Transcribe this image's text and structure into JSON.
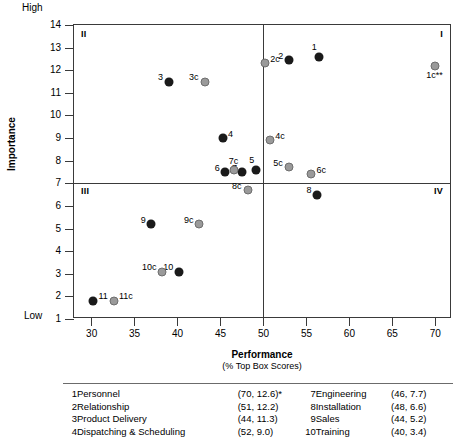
{
  "chart_data": {
    "type": "scatter",
    "title": "",
    "xlabel": "Performance",
    "xsublabel": "(% Top Box Scores)",
    "ylabel": "Importance",
    "xlim": [
      28,
      72
    ],
    "ylim": [
      1,
      14
    ],
    "xticks": [
      30,
      35,
      40,
      45,
      50,
      55,
      60,
      65,
      70
    ],
    "yticks": [
      1,
      2,
      3,
      4,
      5,
      6,
      7,
      8,
      9,
      10,
      11,
      12,
      13,
      14
    ],
    "y_high_label": "High",
    "y_low_label": "Low",
    "grid": false,
    "legend_position": "below-table",
    "quadrant_labels": {
      "q1": "I",
      "q2": "II",
      "q3": "III",
      "q4": "IV"
    },
    "reference_lines": {
      "vertical_x": 50,
      "horizontal_y": 7
    },
    "series": [
      {
        "name": "Company",
        "color": "#1a1a1a",
        "points": [
          {
            "label": "1",
            "x": 56.5,
            "y": 12.6,
            "label_pos": "top-left"
          },
          {
            "label": "2",
            "x": 53.0,
            "y": 12.45,
            "label_pos": "left"
          },
          {
            "label": "3",
            "x": 39.0,
            "y": 11.5,
            "label_pos": "left"
          },
          {
            "label": "4",
            "x": 45.3,
            "y": 9.0,
            "label_pos": "right"
          },
          {
            "label": "5",
            "x": 49.2,
            "y": 7.6,
            "label_pos": "top-left"
          },
          {
            "label": "6",
            "x": 45.6,
            "y": 7.5,
            "label_pos": "left"
          },
          {
            "label": "7",
            "x": 47.6,
            "y": 7.5,
            "label_pos": "left"
          },
          {
            "label": "8",
            "x": 56.3,
            "y": 6.5,
            "label_pos": "left"
          },
          {
            "label": "9",
            "x": 37.0,
            "y": 5.2,
            "label_pos": "left"
          },
          {
            "label": "10",
            "x": 40.2,
            "y": 3.1,
            "label_pos": "left"
          },
          {
            "label": "11",
            "x": 30.2,
            "y": 1.8,
            "label_pos": "right"
          }
        ]
      },
      {
        "name": "Competitor",
        "color": "#9a9a9a",
        "points": [
          {
            "label": "1c**",
            "x": 70.0,
            "y": 12.2,
            "label_pos": "bottom"
          },
          {
            "label": "2c",
            "x": 50.2,
            "y": 12.3,
            "label_pos": "right"
          },
          {
            "label": "3c",
            "x": 43.2,
            "y": 11.5,
            "label_pos": "left"
          },
          {
            "label": "4c",
            "x": 50.8,
            "y": 8.9,
            "label_pos": "right"
          },
          {
            "label": "5c",
            "x": 53.0,
            "y": 7.7,
            "label_pos": "left"
          },
          {
            "label": "6c",
            "x": 55.6,
            "y": 7.4,
            "label_pos": "right"
          },
          {
            "label": "7c",
            "x": 46.6,
            "y": 7.6,
            "label_pos": "top"
          },
          {
            "label": "8c",
            "x": 48.2,
            "y": 6.7,
            "label_pos": "left"
          },
          {
            "label": "9c",
            "x": 42.6,
            "y": 5.2,
            "label_pos": "left"
          },
          {
            "label": "10c",
            "x": 38.3,
            "y": 3.1,
            "label_pos": "left"
          },
          {
            "label": "11c",
            "x": 32.6,
            "y": 1.8,
            "label_pos": "right"
          }
        ]
      }
    ]
  },
  "legend_table": {
    "rows": [
      {
        "num_left": "1",
        "name_left": "Personnel",
        "val_left": "(70, 12.6)*",
        "num_right": "7",
        "name_right": "Engineering",
        "val_right": "(46,   7.7)"
      },
      {
        "num_left": "2",
        "name_left": "Relationship",
        "val_left": "(51, 12.2)",
        "num_right": "8",
        "name_right": "Installation",
        "val_right": "(48,   6.6)"
      },
      {
        "num_left": "3",
        "name_left": "Product Delivery",
        "val_left": "(44, 11.3)",
        "num_right": "9",
        "name_right": "Sales",
        "val_right": "(44,   5.2)"
      },
      {
        "num_left": "4",
        "name_left": "Dispatching & Scheduling",
        "val_left": "(52,   9.0)",
        "num_right": "10",
        "name_right": "Training",
        "val_right": "(40,   3.4)"
      }
    ]
  }
}
